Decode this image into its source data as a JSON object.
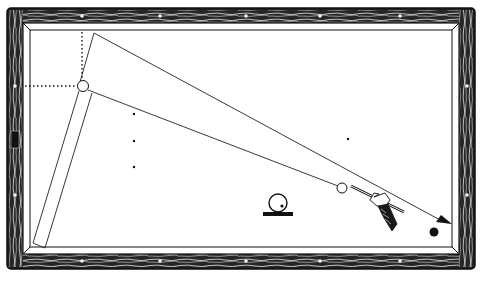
{
  "diagram": {
    "type": "billiards-shot-diagram",
    "colors": {
      "background": "#ffffff",
      "ink": "#111111",
      "rail_wood": "#2a2a2a",
      "wood_grain": "#e8e8e8",
      "cloth": "#ffffff"
    },
    "table": {
      "outer": {
        "x": 8,
        "y": 8,
        "w": 467,
        "h": 260
      },
      "inner_cushion": {
        "x": 23,
        "y": 24,
        "w": 436,
        "h": 229
      },
      "playing_field": {
        "x": 30,
        "y": 31,
        "w": 422,
        "h": 216
      },
      "diamonds_top": [
        82,
        160,
        246,
        320,
        400
      ],
      "diamonds_bottom": [
        82,
        160,
        246,
        320,
        400
      ],
      "diamonds_left": [
        86,
        170
      ],
      "diamonds_right": [
        86,
        170
      ],
      "label_on_left_rail": "DGV"
    },
    "spots": [
      {
        "x": 134,
        "y": 114
      },
      {
        "x": 134,
        "y": 141
      },
      {
        "x": 134,
        "y": 167
      },
      {
        "x": 348,
        "y": 139
      }
    ],
    "balls": [
      {
        "name": "object-ball-white",
        "x": 83,
        "y": 86,
        "r": 5,
        "fill": "#ffffff"
      },
      {
        "name": "cue-ball",
        "x": 342,
        "y": 188,
        "r": 5,
        "fill": "#ffffff"
      },
      {
        "name": "target-ball-black",
        "x": 434,
        "y": 232,
        "r": 4.5,
        "fill": "#111111"
      }
    ],
    "paths": {
      "cue_ball_path": [
        [
          342,
          188
        ],
        [
          94,
          91
        ],
        [
          36,
          244
        ],
        [
          45,
          247
        ],
        [
          95,
          33
        ],
        [
          440,
          222
        ]
      ],
      "dotted_guides": [
        [
          [
            82,
            34
          ],
          [
            82,
            81
          ]
        ],
        [
          [
            26,
            86
          ],
          [
            78,
            86
          ]
        ]
      ]
    },
    "arrow": {
      "at": [
        452,
        224
      ],
      "direction_deg": 27
    },
    "english_symbol": {
      "cx": 278,
      "cy": 203,
      "r": 9,
      "dot": [
        283,
        207
      ],
      "base": {
        "x": 263,
        "y": 212,
        "w": 30,
        "h": 4
      }
    },
    "cue": {
      "tip": [
        352,
        186
      ],
      "butt": [
        405,
        212
      ]
    }
  }
}
